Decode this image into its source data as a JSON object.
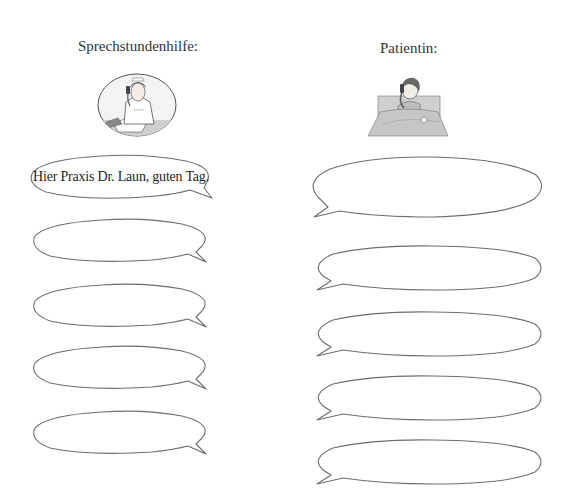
{
  "columns": [
    {
      "role": "receptionist",
      "heading": "Sprechstundenhilfe:",
      "illustration": "nurse-on-phone-at-desk-icon",
      "bubbles": [
        {
          "text": "Hier Praxis Dr. Laun, guten Tag."
        },
        {
          "text": ""
        },
        {
          "text": ""
        },
        {
          "text": ""
        },
        {
          "text": ""
        }
      ]
    },
    {
      "role": "patient",
      "heading": "Patientin:",
      "illustration": "patient-in-bed-on-phone-icon",
      "bubbles": [
        {
          "text": ""
        },
        {
          "text": ""
        },
        {
          "text": ""
        },
        {
          "text": ""
        },
        {
          "text": ""
        }
      ]
    }
  ],
  "colors": {
    "outline": "#6e6e6e",
    "text": "#1e1e1e",
    "background": "#ffffff"
  }
}
